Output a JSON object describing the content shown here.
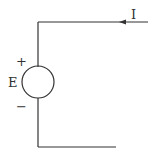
{
  "diagram": {
    "type": "circuit",
    "source": {
      "label": "E",
      "plus": "+",
      "minus": "−"
    },
    "current": {
      "label": "I",
      "direction": "left"
    },
    "colors": {
      "wire": "#333333",
      "background": "#ffffff"
    }
  }
}
